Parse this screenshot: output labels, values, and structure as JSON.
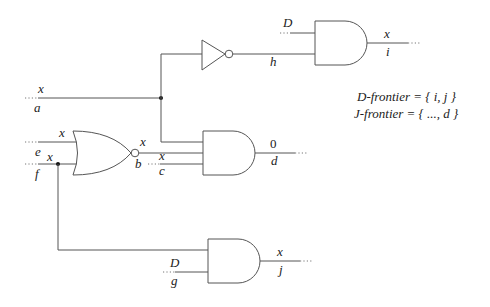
{
  "diagram": {
    "type": "logic-circuit",
    "annotations": {
      "d_frontier": "D-frontier = { i, j }",
      "j_frontier": "J-frontier = { ..., d }"
    },
    "signals": {
      "a": {
        "name": "a",
        "value": "x"
      },
      "e": {
        "name": "e",
        "value": "x"
      },
      "f": {
        "name": "f",
        "value": "x"
      },
      "b": {
        "name": "b",
        "value": "x"
      },
      "c": {
        "name": "c",
        "value": "x"
      },
      "d": {
        "name": "d",
        "value": "0"
      },
      "g": {
        "name": "g",
        "value": "D"
      },
      "h": {
        "name": "h",
        "value": ""
      },
      "h_in": {
        "name": "",
        "value": "D"
      },
      "i": {
        "name": "i",
        "value": "x"
      },
      "j": {
        "name": "j",
        "value": "x"
      }
    },
    "gates": [
      {
        "id": "inv-h",
        "type": "NOT",
        "inputs": [
          "a"
        ],
        "output": "h"
      },
      {
        "id": "and-i",
        "type": "AND",
        "inputs": [
          "D",
          "h"
        ],
        "output": "i"
      },
      {
        "id": "nor-b",
        "type": "NOR",
        "inputs": [
          "e",
          "f"
        ],
        "output": "b"
      },
      {
        "id": "and-d",
        "type": "AND",
        "inputs": [
          "a",
          "b",
          "c"
        ],
        "output": "d"
      },
      {
        "id": "and-j",
        "type": "AND",
        "inputs": [
          "f",
          "g"
        ],
        "output": "j"
      }
    ]
  }
}
